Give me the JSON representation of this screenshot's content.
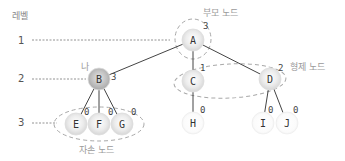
{
  "diagram": {
    "level_title": "레벨",
    "levels": [
      {
        "label": "1"
      },
      {
        "label": "2"
      },
      {
        "label": "3"
      }
    ],
    "nodes": [
      {
        "id": "A",
        "label": "A",
        "degree": "3",
        "style": "shaded"
      },
      {
        "id": "B",
        "label": "B",
        "degree": "3",
        "style": "dark"
      },
      {
        "id": "C",
        "label": "C",
        "degree": "1",
        "style": "shaded"
      },
      {
        "id": "D",
        "label": "D",
        "degree": "2",
        "style": "shaded"
      },
      {
        "id": "E",
        "label": "E",
        "degree": "0",
        "style": "shaded"
      },
      {
        "id": "F",
        "label": "F",
        "degree": "0",
        "style": "shaded"
      },
      {
        "id": "G",
        "label": "G",
        "degree": "0",
        "style": "shaded"
      },
      {
        "id": "H",
        "label": "H",
        "degree": "0",
        "style": "plain"
      },
      {
        "id": "I",
        "label": "I",
        "degree": "0",
        "style": "plain"
      },
      {
        "id": "J",
        "label": "J",
        "degree": "0",
        "style": "plain"
      }
    ],
    "edges": [
      [
        "A",
        "B"
      ],
      [
        "A",
        "C"
      ],
      [
        "A",
        "D"
      ],
      [
        "B",
        "E"
      ],
      [
        "B",
        "F"
      ],
      [
        "B",
        "G"
      ],
      [
        "C",
        "H"
      ],
      [
        "D",
        "I"
      ],
      [
        "D",
        "J"
      ]
    ],
    "annotations": {
      "parent": "부모 노드",
      "self": "나",
      "sibling": "형제 노드",
      "descendant": "자손 노드"
    },
    "colors": {
      "edge": "#444444",
      "group_outline": "#a8a8a8",
      "annotation_text": "#9a9a9a"
    }
  }
}
